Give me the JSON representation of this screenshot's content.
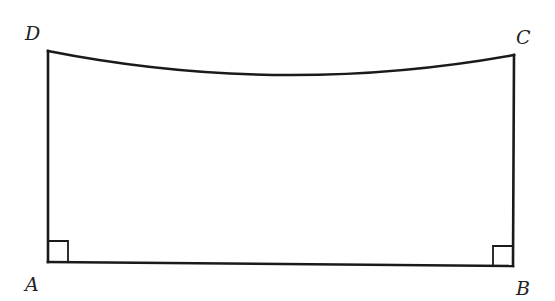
{
  "figure": {
    "type": "quadrilateral with curved top side",
    "vertices": {
      "A": {
        "label": "A",
        "x": 48,
        "y": 262,
        "label_x": 25,
        "label_y": 291
      },
      "B": {
        "label": "B",
        "x": 513,
        "y": 266,
        "label_x": 516,
        "label_y": 295
      },
      "C": {
        "label": "C",
        "x": 514,
        "y": 55,
        "label_x": 516,
        "label_y": 44
      },
      "D": {
        "label": "D",
        "x": 48,
        "y": 51,
        "label_x": 25,
        "label_y": 40
      }
    },
    "edges": [
      {
        "from": "A",
        "to": "B",
        "kind": "straight"
      },
      {
        "from": "B",
        "to": "C",
        "kind": "straight"
      },
      {
        "from": "D",
        "to": "A",
        "kind": "straight"
      },
      {
        "from": "D",
        "to": "C",
        "kind": "arc",
        "sag": "downward (concave)"
      }
    ],
    "right_angles": [
      "A",
      "B"
    ],
    "colors": {
      "stroke": "#1a1a1a",
      "label": "#222222",
      "background": "#ffffff"
    }
  }
}
